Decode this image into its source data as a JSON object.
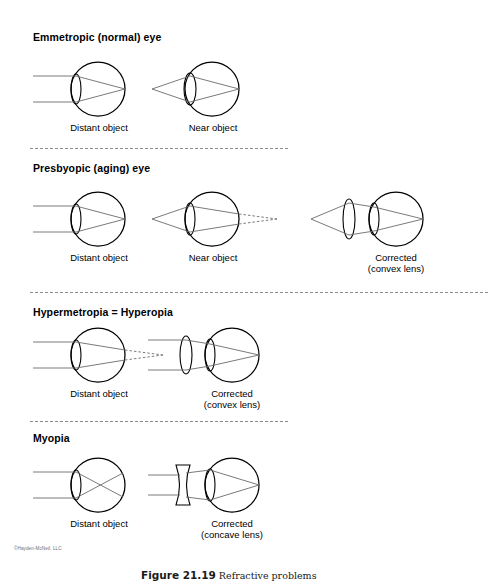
{
  "figure": {
    "caption_number": "Figure 21.19",
    "caption_text": "Refractive problems",
    "copyright": "©Hayden-McNeil, LLC"
  },
  "sections": [
    {
      "id": "emmetropic",
      "title": "Emmetropic (normal) eye",
      "diagrams": [
        {
          "id": "emmetropic-distant",
          "label": "Distant object",
          "label2": ""
        },
        {
          "id": "emmetropic-near",
          "label": "Near object",
          "label2": ""
        }
      ]
    },
    {
      "id": "presbyopic",
      "title": "Presbyopic (aging) eye",
      "diagrams": [
        {
          "id": "presbyopic-distant",
          "label": "Distant object",
          "label2": ""
        },
        {
          "id": "presbyopic-near",
          "label": "Near object",
          "label2": ""
        },
        {
          "id": "presbyopic-corrected",
          "label": "Corrected",
          "label2": "(convex lens)"
        }
      ]
    },
    {
      "id": "hypermetropia",
      "title": "Hypermetropia = Hyperopia",
      "diagrams": [
        {
          "id": "hyperopia-distant",
          "label": "Distant object",
          "label2": ""
        },
        {
          "id": "hyperopia-corrected",
          "label": "Corrected",
          "label2": "(convex lens)"
        }
      ]
    },
    {
      "id": "myopia",
      "title": "Myopia",
      "diagrams": [
        {
          "id": "myopia-distant",
          "label": "Distant object",
          "label2": ""
        },
        {
          "id": "myopia-corrected",
          "label": "Corrected",
          "label2": "(concave lens)"
        }
      ]
    }
  ],
  "colors": {
    "outline": "#000000",
    "ray": "#6b6b6b",
    "divider": "#8a8a8a",
    "copyright_text": "#6d6d6d"
  }
}
